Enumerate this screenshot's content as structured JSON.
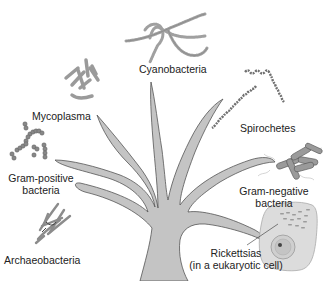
{
  "diagram": {
    "title": "",
    "type": "phylogenetic-tree",
    "colors": {
      "trunk_fill": "#c4c4c4",
      "trunk_stroke": "#555555",
      "organism": "#a8a8a8",
      "organism_dark": "#6e6e6e",
      "text": "#222222"
    },
    "labels": {
      "cyanobacteria": "Cyanobacteria",
      "mycoplasma": "Mycoplasma",
      "spirochetes": "Spirochetes",
      "gram_positive_1": "Gram-positive",
      "gram_positive_2": "bacteria",
      "gram_negative_1": "Gram-negative",
      "gram_negative_2": "bacteria",
      "archaeobacteria": "Archaeobacteria",
      "rickettsias_1": "Rickettsias",
      "rickettsias_2": "(in a eukaryotic cell)"
    },
    "branches": [
      {
        "name": "Cyanobacteria",
        "icon": "filament-icon"
      },
      {
        "name": "Mycoplasma",
        "icon": "rod-cluster-icon"
      },
      {
        "name": "Spirochetes",
        "icon": "spiral-icon"
      },
      {
        "name": "Gram-positive bacteria",
        "icon": "cocci-chain-icon"
      },
      {
        "name": "Gram-negative bacteria",
        "icon": "bacilli-icon"
      },
      {
        "name": "Archaeobacteria",
        "icon": "branching-filament-icon"
      },
      {
        "name": "Rickettsias (in a eukaryotic cell)",
        "icon": "eukaryotic-cell-icon"
      }
    ]
  }
}
